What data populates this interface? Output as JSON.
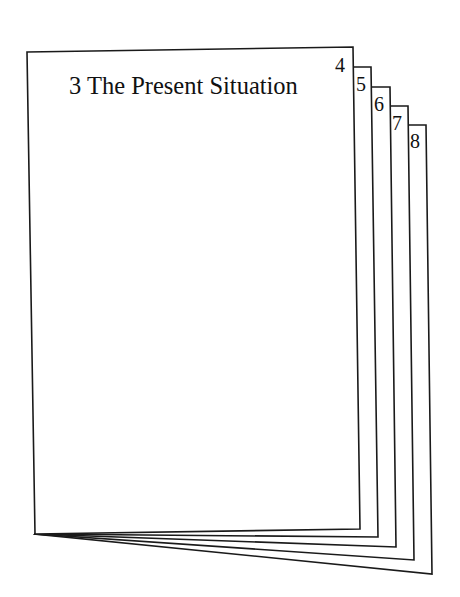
{
  "figure": {
    "type": "fanned-booklet",
    "front_page": {
      "page_number": "3",
      "title": "3 The Present Situation"
    },
    "tab_pages": [
      {
        "page_number": "4"
      },
      {
        "page_number": "5"
      },
      {
        "page_number": "6"
      },
      {
        "page_number": "7"
      },
      {
        "page_number": "8"
      }
    ],
    "stroke_color": "#1a1a1a",
    "background_color": "#ffffff"
  }
}
